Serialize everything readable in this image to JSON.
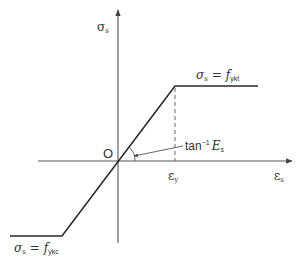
{
  "diagram": {
    "type": "bilinear stress-strain (elastic-perfectly plastic) diagram",
    "axes": {
      "y_label": "σ",
      "y_label_sub": "s",
      "x_label": "ε",
      "x_label_sub": "s",
      "origin_label": "O"
    },
    "annotations": {
      "upper_plateau_lhs": "σ",
      "upper_plateau_lhs_sub": "s",
      "upper_plateau_eq": "=",
      "upper_plateau_rhs": "f",
      "upper_plateau_rhs_sub": "ykt",
      "lower_plateau_lhs": "σ",
      "lower_plateau_lhs_sub": "s",
      "lower_plateau_eq": "=",
      "lower_plateau_rhs": "f",
      "lower_plateau_rhs_sub": "ykc",
      "slope_label": "tan",
      "slope_label_sup": "−1",
      "slope_label_var": "E",
      "slope_label_sub": "s",
      "yield_strain_label": "ε",
      "yield_strain_sub": "y"
    },
    "colors": {
      "line": "#2a2a2a",
      "axis": "#555555",
      "text": "#333333"
    }
  }
}
